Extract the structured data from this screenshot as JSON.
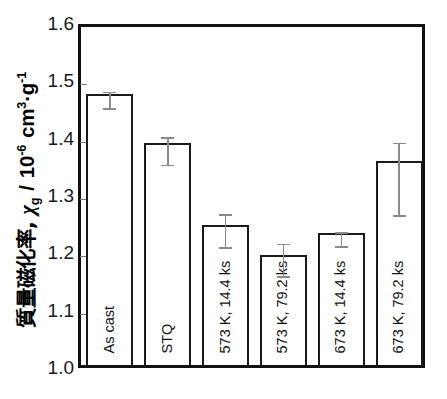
{
  "chart_data": {
    "type": "bar",
    "title": "",
    "xlabel": "",
    "ylabel": "質量磁化率, χg  / 10-6 cm3·g-1",
    "ylabel_parts": {
      "japanese": "質量磁化率,",
      "symbol": "χ",
      "symbol_sub": "g",
      "separator": "/",
      "unit_mantissa": "10",
      "unit_exponent": "-6",
      "unit_rest": "cm",
      "unit_rest_sup": "3",
      "unit_dot": "·",
      "unit_g": "g",
      "unit_g_sup": "-1"
    },
    "ylim": [
      1.0,
      1.6
    ],
    "ytick_values": [
      "1.6",
      "1.5",
      "1.4",
      "1.3",
      "1.2",
      "1.1",
      "1.0"
    ],
    "grid": false,
    "legend": null,
    "categories": [
      "As cast",
      "STQ",
      "573 K, 14.4 ks",
      "573 K, 79.2 ks",
      "673 K, 14.4 ks",
      "673 K, 79.2 ks"
    ],
    "values": [
      1.473,
      1.387,
      1.245,
      1.192,
      1.23,
      1.355
    ],
    "errors_upper": [
      1.487,
      1.408,
      1.273,
      1.222,
      1.242,
      1.398
    ],
    "errors_lower": [
      1.458,
      1.36,
      1.216,
      1.165,
      1.218,
      1.272
    ],
    "bar_fill_color": "#ffffff",
    "bar_edge_color": "#1a1a1a",
    "error_color": "#8a8a8a",
    "axis_color": "#111111"
  }
}
